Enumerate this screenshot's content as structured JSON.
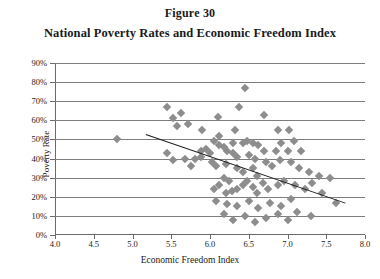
{
  "figure": {
    "number": "Figure 30",
    "title": "National Poverty Rates and Economic Freedom Index"
  },
  "chart_data": {
    "type": "scatter",
    "title": "National Poverty Rates and Economic Freedom Index",
    "subtitle": "Figure 30",
    "xlabel": "Economic Freedom Index",
    "ylabel": "Poverty Rate",
    "xlim": [
      4.0,
      8.0
    ],
    "ylim": [
      0,
      90
    ],
    "xticks": [
      4.0,
      4.5,
      5.0,
      5.5,
      6.0,
      6.5,
      7.0,
      7.5,
      8.0
    ],
    "xtick_labels": [
      "4.0",
      "4.5",
      "5.0",
      "5.5",
      "6.0",
      "6.5",
      "7.0",
      "7.5",
      "8.0"
    ],
    "yticks": [
      0,
      10,
      20,
      30,
      40,
      50,
      60,
      70,
      80,
      90
    ],
    "ytick_labels": [
      "0%",
      "10%",
      "20%",
      "30%",
      "40%",
      "50%",
      "60%",
      "70%",
      "80%",
      "90%"
    ],
    "grid": "horizontal",
    "legend": "none",
    "marker": "diamond",
    "marker_color": "#8d8d8d",
    "trendline_color": "#1c1c1c",
    "trendline": {
      "x0": 5.18,
      "y0": 53.0,
      "x1": 7.76,
      "y1": 17.0
    },
    "points": [
      {
        "x": 4.8,
        "y": 50
      },
      {
        "x": 5.45,
        "y": 67
      },
      {
        "x": 5.52,
        "y": 61
      },
      {
        "x": 5.62,
        "y": 64
      },
      {
        "x": 5.58,
        "y": 57
      },
      {
        "x": 5.72,
        "y": 58
      },
      {
        "x": 5.9,
        "y": 55
      },
      {
        "x": 6.1,
        "y": 62
      },
      {
        "x": 6.12,
        "y": 52
      },
      {
        "x": 6.32,
        "y": 55
      },
      {
        "x": 6.38,
        "y": 67
      },
      {
        "x": 6.45,
        "y": 77
      },
      {
        "x": 6.7,
        "y": 63
      },
      {
        "x": 6.88,
        "y": 55
      },
      {
        "x": 7.02,
        "y": 55
      },
      {
        "x": 6.3,
        "y": 48
      },
      {
        "x": 6.42,
        "y": 48
      },
      {
        "x": 6.48,
        "y": 49
      },
      {
        "x": 6.55,
        "y": 48
      },
      {
        "x": 6.62,
        "y": 47
      },
      {
        "x": 6.05,
        "y": 49
      },
      {
        "x": 6.12,
        "y": 47
      },
      {
        "x": 6.18,
        "y": 46
      },
      {
        "x": 6.22,
        "y": 44
      },
      {
        "x": 6.0,
        "y": 43
      },
      {
        "x": 5.95,
        "y": 45
      },
      {
        "x": 5.88,
        "y": 44
      },
      {
        "x": 6.3,
        "y": 43
      },
      {
        "x": 6.35,
        "y": 41
      },
      {
        "x": 6.5,
        "y": 42
      },
      {
        "x": 6.58,
        "y": 40
      },
      {
        "x": 6.7,
        "y": 44
      },
      {
        "x": 6.85,
        "y": 44
      },
      {
        "x": 7.0,
        "y": 44
      },
      {
        "x": 7.18,
        "y": 44
      },
      {
        "x": 6.92,
        "y": 48
      },
      {
        "x": 7.08,
        "y": 49
      },
      {
        "x": 5.52,
        "y": 39
      },
      {
        "x": 5.45,
        "y": 43
      },
      {
        "x": 5.68,
        "y": 40
      },
      {
        "x": 5.8,
        "y": 40
      },
      {
        "x": 5.88,
        "y": 41
      },
      {
        "x": 5.75,
        "y": 36
      },
      {
        "x": 6.02,
        "y": 38
      },
      {
        "x": 6.08,
        "y": 36
      },
      {
        "x": 6.2,
        "y": 37
      },
      {
        "x": 6.35,
        "y": 35
      },
      {
        "x": 6.42,
        "y": 33
      },
      {
        "x": 6.55,
        "y": 35
      },
      {
        "x": 6.6,
        "y": 31
      },
      {
        "x": 6.72,
        "y": 38
      },
      {
        "x": 6.8,
        "y": 36
      },
      {
        "x": 6.9,
        "y": 39
      },
      {
        "x": 7.05,
        "y": 38
      },
      {
        "x": 7.15,
        "y": 35
      },
      {
        "x": 7.28,
        "y": 33
      },
      {
        "x": 7.4,
        "y": 31
      },
      {
        "x": 7.55,
        "y": 30
      },
      {
        "x": 6.18,
        "y": 30
      },
      {
        "x": 6.25,
        "y": 28
      },
      {
        "x": 6.12,
        "y": 26
      },
      {
        "x": 6.05,
        "y": 24
      },
      {
        "x": 6.2,
        "y": 22
      },
      {
        "x": 6.28,
        "y": 23
      },
      {
        "x": 6.35,
        "y": 24
      },
      {
        "x": 6.42,
        "y": 26
      },
      {
        "x": 6.48,
        "y": 28
      },
      {
        "x": 6.55,
        "y": 25
      },
      {
        "x": 6.6,
        "y": 22
      },
      {
        "x": 6.68,
        "y": 27
      },
      {
        "x": 6.75,
        "y": 24
      },
      {
        "x": 6.88,
        "y": 26
      },
      {
        "x": 6.95,
        "y": 28
      },
      {
        "x": 7.1,
        "y": 26
      },
      {
        "x": 7.22,
        "y": 24
      },
      {
        "x": 7.32,
        "y": 27
      },
      {
        "x": 7.45,
        "y": 22
      },
      {
        "x": 7.62,
        "y": 17
      },
      {
        "x": 6.08,
        "y": 18
      },
      {
        "x": 6.22,
        "y": 16
      },
      {
        "x": 6.35,
        "y": 15
      },
      {
        "x": 6.5,
        "y": 18
      },
      {
        "x": 6.62,
        "y": 14
      },
      {
        "x": 6.78,
        "y": 17
      },
      {
        "x": 6.92,
        "y": 15
      },
      {
        "x": 7.05,
        "y": 19
      },
      {
        "x": 6.18,
        "y": 11
      },
      {
        "x": 6.45,
        "y": 10
      },
      {
        "x": 6.3,
        "y": 8
      },
      {
        "x": 6.72,
        "y": 9
      },
      {
        "x": 6.88,
        "y": 11
      },
      {
        "x": 7.12,
        "y": 12
      },
      {
        "x": 7.3,
        "y": 10
      },
      {
        "x": 6.58,
        "y": 7
      },
      {
        "x": 7.0,
        "y": 8
      }
    ]
  }
}
